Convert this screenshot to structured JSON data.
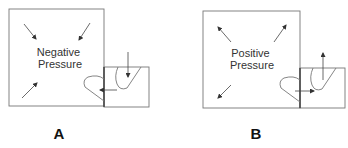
{
  "colors": {
    "line": "#555555",
    "text": "#333333",
    "label": "#111111",
    "background": "#ffffff"
  },
  "panels": [
    {
      "id": "A",
      "label": "A",
      "room_text": [
        "Negative",
        "Pressure"
      ],
      "airflow": "inward"
    },
    {
      "id": "B",
      "label": "B",
      "room_text": [
        "Positive",
        "Pressure"
      ],
      "airflow": "outward"
    }
  ]
}
